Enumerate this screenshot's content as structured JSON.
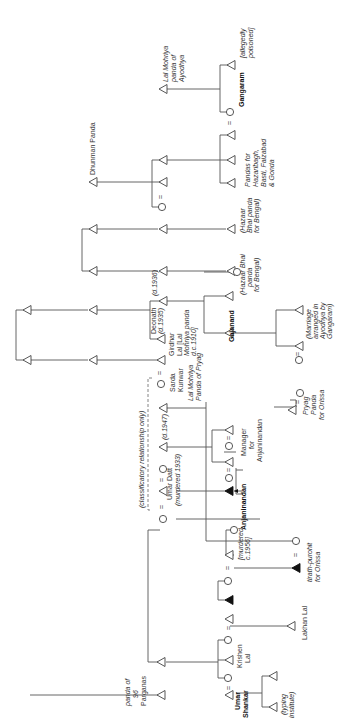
{
  "diagram": {
    "type": "kinship-chart",
    "orientation": "rotated-90-ccw",
    "symbols": {
      "male": "open triangle",
      "female": "open circle",
      "male_highlighted": "filled triangle",
      "marriage": "="
    },
    "labels": {
      "dhunman": "Dhunman Panda",
      "lal_mohriya_ayodhya_1": "Lal Mohriya",
      "lal_mohriya_ayodhya_2": "panda of",
      "lal_mohriya_ayodhya_3": "Ayodhya",
      "allegedly_1": "[allegedly",
      "allegedly_2": "poisoned]",
      "gangaram": "Gangaram",
      "pandas_for_1": "Pandas for",
      "pandas_for_2": "Hazaribagh,",
      "pandas_for_3": "Basti, Faizabad",
      "pandas_for_4": "& Gonda",
      "hazaar_a_1": "(Hazaar",
      "hazaar_a_2": "Bhai panda",
      "hazaar_a_3": "for Bengal)",
      "hazaar_b_1": "(Hazaar Bhai",
      "hazaar_b_2": "panda",
      "hazaar_b_3": "for Bengal)",
      "d1936": "(d.1936)",
      "deonath": "Deonath",
      "d1935": "(d.1935)",
      "gajanand": "Gajanand",
      "marriage_1": "(Marriage",
      "marriage_2": "arranged in",
      "marriage_3": "Ayodhya by",
      "marriage_4": "Gangaram)",
      "girdhar_1": "Girdhar",
      "girdhar_2": "Lal [Lal",
      "girdhar_3": "Mohriya panda",
      "girdhar_4": "d.c.1910]",
      "sarda_1": "Sarda",
      "sarda_2": "Kunwar",
      "lal_mohriya_pryag_1": "Lal Mohriya",
      "lal_mohriya_pryag_2": "Panda of Pryag",
      "pryag_1": "Pryag",
      "pryag_2": "Panda",
      "pryag_3": "for Orissa",
      "classificatory": "(classificatory relationship only)",
      "d1947": "(d.1947)",
      "manager_1": "Manager",
      "manager_2": "for",
      "manager_3": "Anjaninandan",
      "umar_datt": "Umar Datt",
      "murdered_1933": "(murdered 1933)",
      "anjaninandan": "Anjaninandan",
      "murdered_1956_1": "[murdered",
      "murdered_1956_2": "c.1956]",
      "tirath_1": "tirath-purohit",
      "tirath_2": "for Orissa",
      "lakhan_lal": "Lakhan Lal",
      "krishen_1": "Krishen",
      "krishen_2": "Lal",
      "panda96_1": "panda of",
      "panda96_2": "96",
      "panda96_3": "Parganas",
      "umar_shankar_1": "Umar",
      "umar_shankar_2": "Shankar",
      "typing_1": "(typing",
      "typing_2": "institute)",
      "eq": "="
    }
  }
}
